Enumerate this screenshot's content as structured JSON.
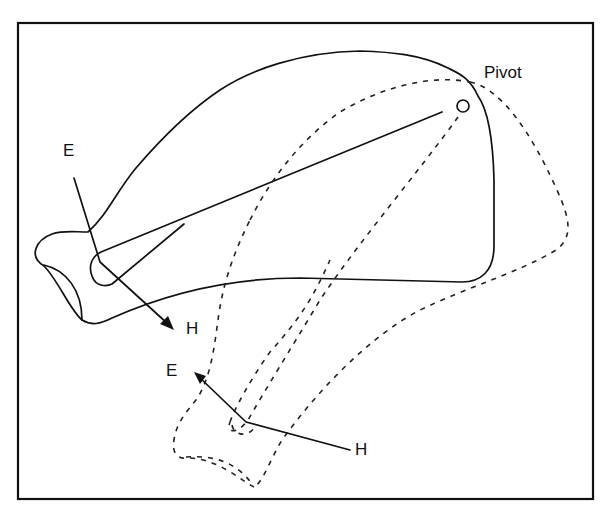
{
  "diagram": {
    "labels": {
      "pivot": "Pivot",
      "e_initial": "E",
      "h_initial": "H",
      "e_rotated": "E",
      "h_rotated": "H"
    },
    "styles": {
      "stroke_color": "#111111",
      "background": "#ffffff",
      "initial_position": "solid",
      "rotated_position": "dashed"
    }
  }
}
